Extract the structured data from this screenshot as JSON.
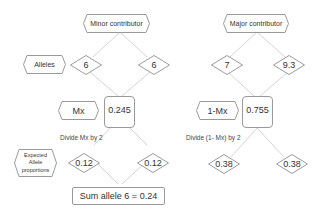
{
  "minor": {
    "title": "Minor contributor",
    "alleles_label": "Alleles",
    "allele_a": "6",
    "allele_b": "6",
    "mx_label": "Mx",
    "mx_value": "0.245",
    "divide_note": "Divide Mx by 2",
    "expected_label": "Expected Allele proportions",
    "prop_a": "0.12",
    "prop_b": "0.12",
    "sum": "Sum allele 6 = 0.24"
  },
  "major": {
    "title": "Major contributor",
    "allele_a": "7",
    "allele_b": "9.3",
    "mx_label": "1-Mx",
    "mx_value": "0.755",
    "divide_note": "Divide (1- Mx) by 2",
    "prop_a": "0.38",
    "prop_b": "0.38"
  },
  "colors": {
    "line": "#d0d0d0",
    "border": "#9a9a9a"
  }
}
